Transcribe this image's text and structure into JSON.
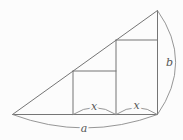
{
  "figure": {
    "kind": "geometry-diagram",
    "colors": {
      "background": "#fcfcfc",
      "line": "#757575",
      "arc": "#8a8a8a",
      "label": "#565656"
    },
    "labels": {
      "left_segment": "x",
      "right_segment": "x",
      "base": "a",
      "vertical_leg": "b"
    }
  }
}
